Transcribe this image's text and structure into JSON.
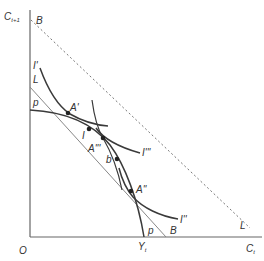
{
  "diagram": {
    "axes": {
      "y_label": "C",
      "y_label_sub": "t+1",
      "x_label": "C",
      "x_label_sub": "t",
      "origin": "O",
      "x_point": "Y",
      "x_point_sub": "t"
    },
    "labels": {
      "B_top": "B",
      "B_bottom": "B",
      "L_left": "L",
      "L_right": "L",
      "p_top": "p",
      "p_bottom": "p",
      "I_prime": "I'",
      "I": "I",
      "I_triple": "I'''",
      "I_double": "I''",
      "A_prime": "A'",
      "A_triple": "A'''",
      "A_double": "A''",
      "b": "b"
    },
    "colors": {
      "curve": "#3a3a3a",
      "axis": "#555555",
      "line": "#888888",
      "dotted": "#777777"
    },
    "lines": [
      {
        "name": "B-L dotted budget line",
        "style": "dotted"
      },
      {
        "name": "L-B tangent line",
        "style": "solid"
      },
      {
        "name": "p-p production possibility curve",
        "style": "solid"
      }
    ],
    "curves": [
      "I'",
      "I'''",
      "I''"
    ],
    "points": [
      "A'",
      "I",
      "A'''",
      "b",
      "A''"
    ]
  }
}
